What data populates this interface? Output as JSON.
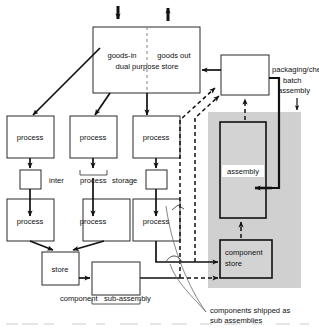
{
  "diagram": {
    "colors": {
      "ink": "#111111",
      "shade": "#d0d0d0",
      "paper": "#ffffff"
    },
    "top_store": {
      "goods_in": "goods-in",
      "goods_out": "goods out",
      "subtitle": "dual purpose store"
    },
    "packaging": {
      "label": "packaging/check"
    },
    "batch": {
      "line1": "batch",
      "line2": "assembly"
    },
    "assembly": {
      "label": "assembly"
    },
    "component_store": {
      "line1": "component",
      "line2": "store"
    },
    "processes": [
      {
        "label": "process"
      },
      {
        "label": "process"
      },
      {
        "label": "process"
      },
      {
        "label": "process"
      },
      {
        "label": "process"
      },
      {
        "label": "process"
      }
    ],
    "inter_storage": {
      "word1": "inter",
      "word2": "process",
      "word3": "storage"
    },
    "store": {
      "label": "store"
    },
    "sub_assembly": {
      "word1": "component",
      "word2": "sub-assembly"
    },
    "note": {
      "line1": "components shipped as",
      "line2": "sub assemblies"
    },
    "arrows": {
      "goods_in_icon": "arrow-down-icon",
      "goods_out_icon": "arrow-up-icon",
      "batch_pointer_icon": "arrow-down-icon"
    }
  }
}
